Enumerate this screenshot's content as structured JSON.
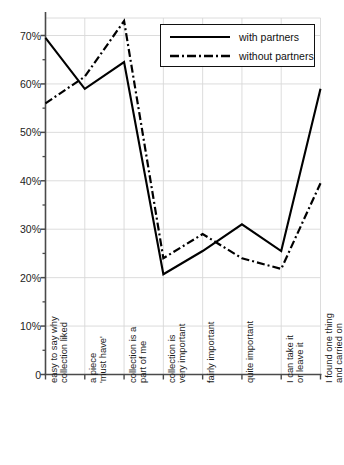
{
  "chart_data": {
    "type": "line",
    "title": "",
    "xlabel": "",
    "ylabel": "",
    "ylim": [
      0,
      75
    ],
    "ytick_values": [
      0,
      10,
      20,
      30,
      40,
      50,
      60,
      70
    ],
    "ytick_labels": [
      "0",
      "10%",
      "20%",
      "30%",
      "40%",
      "50%",
      "60%",
      "70%"
    ],
    "yminor_step": 5,
    "grid": true,
    "legend_position": "top-right",
    "categories": [
      "easy to say why collection liked",
      "a piece 'must have'",
      "collection is a part of me",
      "collection is very important",
      "fairly important",
      "quite important",
      "I can take it or leave it",
      "I found one thing and carried on"
    ],
    "category_label_lines": [
      [
        "easy to say why",
        "collection liked"
      ],
      [
        "a piece",
        "'must have'"
      ],
      [
        "collection is a",
        "part of me"
      ],
      [
        "collection is",
        "very important"
      ],
      [
        "fairly important",
        ""
      ],
      [
        "quite important",
        ""
      ],
      [
        "I can take it",
        "or leave it"
      ],
      [
        "I found one thing",
        "and carried on"
      ]
    ],
    "series": [
      {
        "name": "with partners",
        "style": "solid",
        "color": "#000000",
        "values": [
          69.5,
          59.0,
          64.5,
          20.7,
          25.5,
          31.0,
          25.5,
          59.0
        ]
      },
      {
        "name": "without partners",
        "style": "dash-dot",
        "color": "#000000",
        "values": [
          56.0,
          61.5,
          73.0,
          24.0,
          29.0,
          24.0,
          21.8,
          39.5
        ]
      }
    ]
  },
  "legend": {
    "entries": [
      {
        "label": "with partners"
      },
      {
        "label": "without partners"
      }
    ]
  },
  "colors": {
    "axis": "#4a4a4a",
    "grid": "#d8d8d8",
    "line": "#000000",
    "text": "#1a1a1a"
  }
}
